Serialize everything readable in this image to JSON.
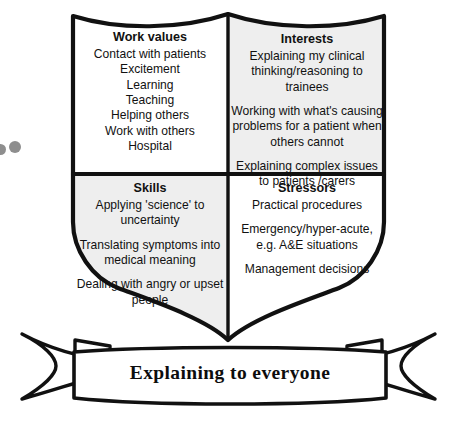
{
  "diagram": {
    "shield": {
      "quadrants": [
        {
          "key": "work_values",
          "heading": "Work values",
          "background": "#ffffff",
          "lines": [
            {
              "text": "Contact with patients",
              "gap": false
            },
            {
              "text": "Excitement",
              "gap": false
            },
            {
              "text": "Learning",
              "gap": false
            },
            {
              "text": "Teaching",
              "gap": false
            },
            {
              "text": "Helping others",
              "gap": false
            },
            {
              "text": "Work with others",
              "gap": false
            },
            {
              "text": "Hospital",
              "gap": false
            }
          ]
        },
        {
          "key": "interests",
          "heading": "Interests",
          "background": "#eeeeee",
          "lines": [
            {
              "text": "Explaining my clinical thinking/reasoning to trainees",
              "gap": false
            },
            {
              "text": "Working with what's causing problems for a patient when others cannot",
              "gap": true
            },
            {
              "text": "Explaining complex issues to patients /carers",
              "gap": true
            }
          ]
        },
        {
          "key": "skills",
          "heading": "Skills",
          "background": "#eeeeee",
          "lines": [
            {
              "text": "Applying 'science' to uncertainty",
              "gap": false
            },
            {
              "text": "Translating symptoms into medical meaning",
              "gap": true
            },
            {
              "text": "Dealing with angry or upset people",
              "gap": true
            }
          ]
        },
        {
          "key": "stressors",
          "heading": "Stressors",
          "background": "#ffffff",
          "lines": [
            {
              "text": "Practical procedures",
              "gap": false
            },
            {
              "text": "Emergency/hyper-acute, e.g. A&E situations",
              "gap": true
            },
            {
              "text": "Management decisions",
              "gap": true
            }
          ]
        }
      ]
    },
    "ribbon": {
      "caption": "Explaining to everyone"
    },
    "colors": {
      "outline": "#111111",
      "shade": "#eeeeee",
      "page": "#ffffff",
      "dot": "#8e8e8e",
      "text": "#111111"
    }
  }
}
